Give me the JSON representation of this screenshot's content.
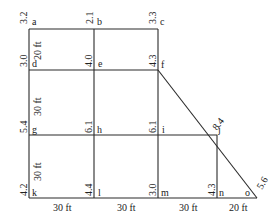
{
  "diagram": {
    "type": "grid-plan",
    "points": [
      {
        "id": "a",
        "label": "a",
        "value": "3.2"
      },
      {
        "id": "b",
        "label": "b",
        "value": "2.1"
      },
      {
        "id": "c",
        "label": "c",
        "value": "3.3"
      },
      {
        "id": "d",
        "label": "d",
        "value": "3.0"
      },
      {
        "id": "e",
        "label": "e",
        "value": "4.0"
      },
      {
        "id": "f",
        "label": "f",
        "value": "4.3"
      },
      {
        "id": "g",
        "label": "g",
        "value": "5.4"
      },
      {
        "id": "h",
        "label": "h",
        "value": "6.1"
      },
      {
        "id": "i",
        "label": "i",
        "value": "6.1"
      },
      {
        "id": "j",
        "label": "j",
        "value": "8.4"
      },
      {
        "id": "k",
        "label": "k",
        "value": "4.2"
      },
      {
        "id": "l",
        "label": "l",
        "value": "4.4"
      },
      {
        "id": "m",
        "label": "m",
        "value": "3.0"
      },
      {
        "id": "n",
        "label": "n",
        "value": "4.3"
      },
      {
        "id": "o",
        "label": "o",
        "value": "5.6"
      }
    ],
    "vertical_dimensions": [
      "20 ft",
      "30 ft",
      "30 ft"
    ],
    "horizontal_dimensions": [
      "30 ft",
      "30 ft",
      "30 ft",
      "20 ft"
    ]
  }
}
